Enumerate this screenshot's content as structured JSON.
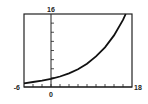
{
  "chart_data": {
    "type": "line",
    "title": "",
    "xlabel": "",
    "ylabel": "",
    "xlim": [
      -6,
      18
    ],
    "ylim": [
      0,
      16
    ],
    "x_tick_interval": 2,
    "y_tick_interval": 2,
    "grid": false,
    "tick_labels": {
      "x_min": "-6",
      "x_max": "18",
      "y_max": "16",
      "origin": "0"
    },
    "series": [
      {
        "name": "exponential growth curve",
        "x": [
          -6,
          -4,
          -2,
          0,
          2,
          4,
          6,
          8,
          10,
          12,
          14,
          16,
          16.6
        ],
        "values": [
          0.8,
          1.1,
          1.4,
          1.8,
          2.3,
          3.0,
          3.9,
          5.1,
          6.7,
          8.7,
          11.3,
          14.7,
          16
        ]
      }
    ],
    "legend": null
  }
}
